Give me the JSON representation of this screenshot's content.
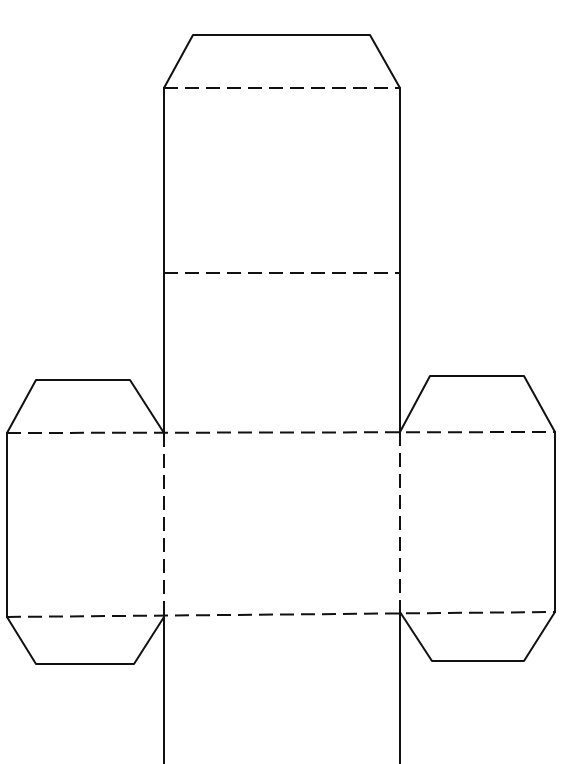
{
  "diagram": {
    "type": "box-net",
    "colors": {
      "line": "#111111",
      "background": "#ffffff"
    },
    "legend": {
      "solid": "cut line",
      "dashed": "fold line"
    },
    "faces": [
      {
        "id": "top-face",
        "x": 164,
        "y": 88,
        "w": 236,
        "h": 185
      },
      {
        "id": "upper-middle-face",
        "x": 164,
        "y": 273,
        "w": 236,
        "h": 160
      },
      {
        "id": "center-face",
        "x": 164,
        "y": 433,
        "w": 236,
        "h": 182
      },
      {
        "id": "bottom-face",
        "x": 164,
        "y": 615,
        "w": 236,
        "h": 149
      },
      {
        "id": "left-face",
        "x": 7,
        "y": 433,
        "w": 157,
        "h": 184
      },
      {
        "id": "right-face",
        "x": 400,
        "y": 432,
        "w": 155,
        "h": 180
      }
    ],
    "flaps": [
      {
        "id": "top-flap",
        "points": "164,88 193,35 370,35 400,88"
      },
      {
        "id": "left-top-flap",
        "points": "7,433 36,380 130,380 164,433"
      },
      {
        "id": "left-bottom-flap",
        "points": "7,617 36,664 134,664 164,617"
      },
      {
        "id": "right-top-flap",
        "points": "400,432 430,376 524,376 555,432"
      },
      {
        "id": "right-bottom-flap",
        "points": "400,612 432,661 524,661 555,612"
      }
    ],
    "cut_lines": [
      {
        "id": "center-left-upper",
        "x1": 164,
        "y1": 88,
        "x2": 164,
        "y2": 433
      },
      {
        "id": "center-right-upper",
        "x1": 400,
        "y1": 88,
        "x2": 400,
        "y2": 432
      },
      {
        "id": "center-left-lower",
        "x1": 164,
        "y1": 617,
        "x2": 164,
        "y2": 764
      },
      {
        "id": "center-right-lower",
        "x1": 400,
        "y1": 612,
        "x2": 400,
        "y2": 764
      },
      {
        "id": "left-outer-edge",
        "x1": 7,
        "y1": 433,
        "x2": 7,
        "y2": 617
      },
      {
        "id": "right-outer-edge",
        "x1": 555,
        "y1": 432,
        "x2": 555,
        "y2": 612
      }
    ],
    "fold_lines": [
      {
        "id": "fold-top-flap",
        "x1": 164,
        "y1": 88,
        "x2": 400,
        "y2": 88
      },
      {
        "id": "fold-upper",
        "x1": 164,
        "y1": 273,
        "x2": 400,
        "y2": 273
      },
      {
        "id": "fold-center-top",
        "x1": 7,
        "y1": 433,
        "x2": 555,
        "y2": 432
      },
      {
        "id": "fold-center-bottom",
        "x1": 7,
        "y1": 617,
        "x2": 555,
        "y2": 612
      },
      {
        "id": "fold-center-left",
        "x1": 164,
        "y1": 433,
        "x2": 164,
        "y2": 617
      },
      {
        "id": "fold-center-right",
        "x1": 400,
        "y1": 432,
        "x2": 400,
        "y2": 612
      }
    ]
  }
}
